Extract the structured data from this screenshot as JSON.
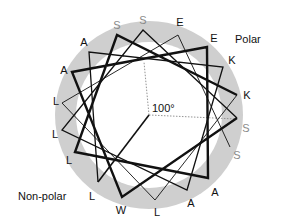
{
  "diagram": {
    "type": "helical-wheel",
    "center": [
      149,
      115
    ],
    "ring": {
      "outer_radius": 94,
      "inner_radius": 73,
      "color": "#cfcfcf"
    },
    "angle_label": "100°",
    "region_labels": {
      "polar": "Polar",
      "nonpolar": "Non-polar"
    },
    "colors": {
      "line": "#111111",
      "label": "#111111",
      "label_polar_s": "#8a8a8a",
      "dotted": "#888888"
    },
    "residues": [
      {
        "n": 1,
        "aa": "L",
        "x": 98,
        "y": 182,
        "lx": 92,
        "ly": 196
      },
      {
        "n": 2,
        "aa": "A",
        "x": 89,
        "y": 52,
        "lx": 84,
        "ly": 42
      },
      {
        "n": 3,
        "aa": "K",
        "x": 223,
        "y": 67,
        "lx": 232,
        "ly": 60
      },
      {
        "n": 4,
        "aa": "A",
        "x": 187,
        "y": 190,
        "lx": 191,
        "ly": 203
      },
      {
        "n": 5,
        "aa": "L",
        "x": 62,
        "y": 130,
        "lx": 55,
        "ly": 134
      },
      {
        "n": 6,
        "aa": "S",
        "x": 143,
        "y": 30,
        "lx": 143,
        "ly": 20
      },
      {
        "n": 7,
        "aa": "S",
        "x": 237,
        "y": 118,
        "lx": 246,
        "ly": 128
      },
      {
        "n": 8,
        "aa": "W",
        "x": 122,
        "y": 197,
        "lx": 121,
        "ly": 210
      },
      {
        "n": 9,
        "aa": "A",
        "x": 72,
        "y": 72,
        "lx": 64,
        "ly": 70
      },
      {
        "n": 10,
        "aa": "E",
        "x": 207,
        "y": 47,
        "lx": 214,
        "ly": 38
      },
      {
        "n": 11,
        "aa": "A",
        "x": 208,
        "y": 178,
        "lx": 215,
        "ly": 192
      },
      {
        "n": 12,
        "aa": "L",
        "x": 75,
        "y": 152,
        "lx": 69,
        "ly": 160
      },
      {
        "n": 13,
        "aa": "S",
        "x": 117,
        "y": 35,
        "lx": 117,
        "ly": 25
      },
      {
        "n": 14,
        "aa": "K",
        "x": 237,
        "y": 95,
        "lx": 247,
        "ly": 95
      },
      {
        "n": 15,
        "aa": "L",
        "x": 155,
        "y": 200,
        "lx": 157,
        "ly": 212
      },
      {
        "n": 16,
        "aa": "L",
        "x": 62,
        "y": 103,
        "lx": 56,
        "ly": 101
      },
      {
        "n": 17,
        "aa": "E",
        "x": 178,
        "y": 35,
        "lx": 180,
        "ly": 22
      },
      {
        "n": 18,
        "aa": "S",
        "x": 230,
        "y": 147,
        "lx": 237,
        "ly": 155
      }
    ],
    "segments": [
      {
        "from": 1,
        "to": 7,
        "width": 1.3
      },
      {
        "from": 7,
        "to": 14,
        "width": 2.4
      },
      {
        "from": 14,
        "to": 18,
        "width": 0.9
      }
    ],
    "start_line": {
      "from": [
        149,
        115
      ],
      "to": [
        98,
        182
      ],
      "width": 1.6
    },
    "polar_sector_lines": [
      {
        "from": [
          149,
          115
        ],
        "to": [
          144,
          62
        ]
      },
      {
        "from": [
          149,
          115
        ],
        "to": [
          236,
          119
        ]
      }
    ]
  },
  "chart_data": {
    "type": "helical-wheel",
    "step_angle_deg": 100,
    "sequence": [
      "L",
      "A",
      "K",
      "A",
      "L",
      "S",
      "S",
      "W",
      "A",
      "E",
      "A",
      "L",
      "S",
      "K",
      "L",
      "L",
      "E",
      "S"
    ],
    "regions": [
      "Polar",
      "Non-polar"
    ],
    "annotation": "100°"
  }
}
